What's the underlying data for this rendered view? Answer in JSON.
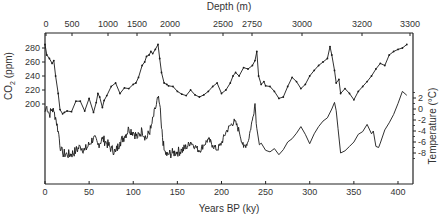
{
  "chart_data": {
    "type": "line",
    "title": "",
    "top_axis": {
      "label": "Depth (m)",
      "ticks": [
        "0",
        "500",
        "1000",
        "1500",
        "2000",
        "2500",
        "2750",
        "3000",
        "3200",
        "3300"
      ],
      "tick_x_px": [
        46,
        72,
        108,
        137,
        170,
        223,
        252,
        302,
        362,
        410
      ]
    },
    "xlabel": "Years BP (ky)",
    "xticks": [
      0,
      50,
      100,
      150,
      200,
      250,
      300,
      350,
      400
    ],
    "xlim": [
      0,
      420
    ],
    "ylabel_left": "CO2 (ppm)",
    "yticks_left": [
      200,
      220,
      240,
      260,
      280
    ],
    "ylabel_right": "Temperature (°C)",
    "yticks_right": [
      2,
      0,
      -2,
      -4,
      -6,
      -8
    ],
    "grid": false,
    "legend": "none",
    "series": [
      {
        "name": "CO2 (ppm)",
        "axis": "left",
        "marker": "dot",
        "x": [
          0,
          2,
          5,
          8,
          10,
          12,
          15,
          17,
          20,
          22,
          25,
          30,
          35,
          40,
          45,
          50,
          55,
          58,
          60,
          62,
          65,
          67,
          70,
          75,
          80,
          85,
          90,
          95,
          100,
          103,
          106,
          110,
          113,
          115,
          118,
          120,
          122,
          125,
          128,
          130,
          132,
          135,
          138,
          140,
          145,
          150,
          155,
          160,
          165,
          170,
          175,
          180,
          185,
          190,
          195,
          200,
          205,
          210,
          213,
          216,
          220,
          225,
          230,
          235,
          238,
          240,
          242,
          245,
          248,
          250,
          255,
          260,
          265,
          270,
          275,
          280,
          285,
          290,
          295,
          300,
          305,
          310,
          315,
          320,
          323,
          325,
          328,
          330,
          333,
          335,
          340,
          345,
          350,
          355,
          360,
          365,
          370,
          375,
          380,
          385,
          390,
          395,
          400,
          405,
          410
        ],
        "values": [
          285,
          270,
          265,
          258,
          262,
          240,
          215,
          192,
          186,
          188,
          190,
          189,
          204,
          204,
          190,
          208,
          188,
          202,
          215,
          210,
          195,
          205,
          212,
          225,
          230,
          215,
          223,
          222,
          228,
          230,
          238,
          255,
          260,
          268,
          270,
          275,
          272,
          278,
          285,
          265,
          245,
          230,
          228,
          226,
          225,
          218,
          214,
          212,
          220,
          213,
          210,
          213,
          218,
          225,
          230,
          215,
          220,
          230,
          240,
          245,
          240,
          252,
          250,
          255,
          262,
          275,
          240,
          228,
          232,
          226,
          225,
          218,
          208,
          210,
          225,
          238,
          232,
          222,
          228,
          240,
          248,
          255,
          260,
          265,
          282,
          270,
          248,
          230,
          235,
          215,
          222,
          215,
          206,
          218,
          225,
          232,
          240,
          250,
          258,
          255,
          270,
          275,
          278,
          280,
          285
        ]
      },
      {
        "name": "Temperature (°C)",
        "axis": "right",
        "marker": "none",
        "x": [
          0,
          2,
          5,
          8,
          10,
          12,
          15,
          18,
          20,
          25,
          30,
          35,
          40,
          45,
          50,
          55,
          60,
          65,
          70,
          75,
          80,
          85,
          90,
          95,
          100,
          105,
          110,
          115,
          120,
          125,
          128,
          130,
          132,
          135,
          138,
          140,
          145,
          150,
          155,
          160,
          165,
          170,
          175,
          180,
          185,
          190,
          195,
          200,
          205,
          210,
          215,
          220,
          225,
          230,
          235,
          238,
          240,
          243,
          245,
          250,
          255,
          260,
          265,
          270,
          275,
          280,
          285,
          290,
          295,
          300,
          305,
          310,
          315,
          320,
          325,
          328,
          330,
          332,
          335,
          340,
          345,
          350,
          355,
          360,
          365,
          370,
          372,
          375,
          378,
          380,
          385,
          390,
          395,
          400,
          405,
          410
        ],
        "values": [
          -0.5,
          0.5,
          -1,
          0,
          -0.5,
          -1.5,
          -4,
          -7.5,
          -8,
          -8.3,
          -8.2,
          -7.6,
          -6.8,
          -7.5,
          -6.5,
          -5.2,
          -6.5,
          -5.4,
          -6.2,
          -7.2,
          -7.8,
          -6,
          -5,
          -3.6,
          -4.2,
          -5.2,
          -3.9,
          -5.4,
          -3.5,
          0,
          2,
          0.8,
          -3.5,
          -7.5,
          -8.5,
          -8.2,
          -8,
          -7.8,
          -7.5,
          -7,
          -6,
          -6.8,
          -7.6,
          -6.5,
          -5.5,
          -6.6,
          -7.4,
          -6.2,
          -4.2,
          -3,
          -2.2,
          -4,
          -7,
          -6,
          -2,
          1,
          -3.5,
          -6.5,
          -6.2,
          -7.5,
          -7.8,
          -7.2,
          -8.3,
          -7.4,
          -6,
          -5.4,
          -4.4,
          -3.2,
          -4.6,
          -6.3,
          -4.5,
          -3.2,
          -2.2,
          -1.6,
          0,
          1.2,
          -0.3,
          -3.5,
          -8,
          -7.6,
          -6.8,
          -6,
          -4.6,
          -4.1,
          -2.8,
          -4.5,
          -4,
          -6.8,
          -7,
          -6.2,
          -3.8,
          -2.5,
          -1,
          1,
          3.2,
          2.5
        ]
      }
    ],
    "annotations": []
  },
  "axes": {
    "top_label": "Depth (m)",
    "bottom_label": "Years BP (ky)",
    "left_label_main": "CO",
    "left_label_sub": "2",
    "left_label_unit": " (ppm)",
    "right_label": "Temperature (°C)"
  },
  "colors": {
    "line": "#1a1a1a",
    "axis": "#222222",
    "text": "#333333"
  }
}
